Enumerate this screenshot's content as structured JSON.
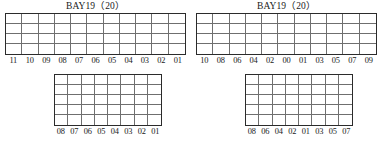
{
  "page": {
    "background": "#ffffff",
    "line_color": "#6f6f6f",
    "frame_color": "#2b2b2b",
    "text_color": "#1a1a1a"
  },
  "blocks": [
    {
      "id": "top-left",
      "title": "BAY19（20）",
      "rows": 4,
      "cols": 11,
      "col_labels": [
        "11",
        "10",
        "09",
        "08",
        "07",
        "06",
        "05",
        "04",
        "03",
        "02",
        "01"
      ]
    },
    {
      "id": "top-right",
      "title": "BAY19（20）",
      "rows": 4,
      "cols": 11,
      "col_labels": [
        "10",
        "08",
        "06",
        "04",
        "02",
        "00",
        "01",
        "03",
        "05",
        "07",
        "09"
      ]
    },
    {
      "id": "bottom-left",
      "title": "",
      "rows": 5,
      "cols": 8,
      "col_labels": [
        "08",
        "07",
        "06",
        "05",
        "04",
        "03",
        "02",
        "01"
      ]
    },
    {
      "id": "bottom-right",
      "title": "",
      "rows": 5,
      "cols": 8,
      "col_labels": [
        "08",
        "06",
        "04",
        "02",
        "01",
        "03",
        "05",
        "07"
      ]
    }
  ]
}
